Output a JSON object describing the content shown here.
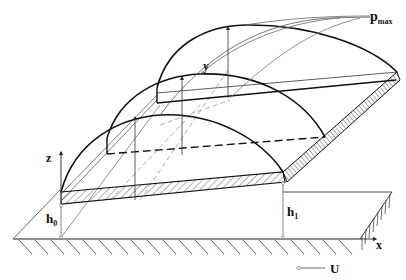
{
  "figure": {
    "labels": {
      "p_max": "p",
      "p_max_sub": "max",
      "y_axis": "y",
      "z_axis": "z",
      "x_axis": "x",
      "h0": "h",
      "h0_sub": "0",
      "h1": "h",
      "h1_sub": "1",
      "velocity": "U",
      "velocity_arrow": "←"
    },
    "colors": {
      "line": "#111111",
      "thin_line": "#333333",
      "guide_line": "#777777",
      "background": "#ffffff"
    }
  }
}
